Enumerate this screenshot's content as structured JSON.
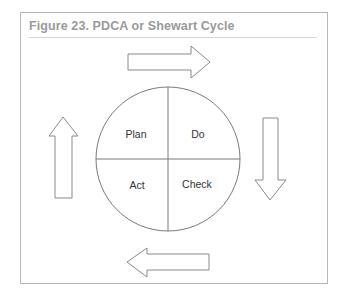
{
  "figure": {
    "title": "Figure 23. PDCA or Shewart Cycle"
  },
  "cycle": {
    "quadrants": [
      {
        "position": "top-left",
        "label": "Plan"
      },
      {
        "position": "top-right",
        "label": "Do"
      },
      {
        "position": "bottom-right",
        "label": "Check"
      },
      {
        "position": "bottom-left",
        "label": "Act"
      }
    ],
    "arrows": [
      {
        "position": "top",
        "direction": "right"
      },
      {
        "position": "right",
        "direction": "down"
      },
      {
        "position": "bottom",
        "direction": "left"
      },
      {
        "position": "left",
        "direction": "up"
      }
    ]
  },
  "colors": {
    "stroke": "#7a7a7a",
    "frame": "#b8b8b8",
    "title": "#9a9a9a"
  }
}
